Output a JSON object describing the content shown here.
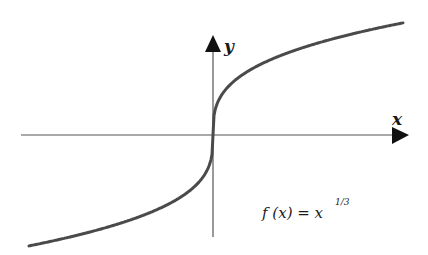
{
  "chart_data": {
    "type": "line",
    "title": "",
    "function": "f(x) = x^(1/3)",
    "xlabel": "x",
    "ylabel": "y",
    "annotation": {
      "lhs": "f (x) = x",
      "exponent": "1/3"
    },
    "grid": false,
    "legend": "none",
    "ticks": "none",
    "origin_px": [
      213,
      135
    ],
    "curve_scale_px": 19.5,
    "x_px_range": [
      -184,
      190
    ],
    "colors": {
      "curve": "#4a4a4a",
      "axes": "#555555",
      "arrows": "#111111",
      "text": "#1a1a1a"
    }
  }
}
